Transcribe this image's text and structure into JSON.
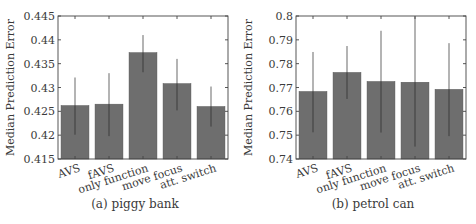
{
  "chart_data": [
    {
      "type": "bar",
      "title": "",
      "caption": "(a) piggy bank",
      "xlabel": "",
      "ylabel": "Median Prediction Error",
      "categories": [
        "AVS",
        "fAVS",
        "only function",
        "move focus",
        "att. switch"
      ],
      "values": [
        0.4262,
        0.4265,
        0.4373,
        0.4308,
        0.426
      ],
      "error_low": [
        0.4201,
        0.4198,
        0.4332,
        0.4252,
        0.4218
      ],
      "error_high": [
        0.4321,
        0.433,
        0.441,
        0.436,
        0.4302
      ],
      "ylim": [
        0.415,
        0.445
      ],
      "yticks": [
        0.415,
        0.42,
        0.425,
        0.43,
        0.435,
        0.44,
        0.445
      ],
      "ytick_labels": [
        "0.415",
        "0.42",
        "0.425",
        "0.43",
        "0.435",
        "0.44",
        "0.445"
      ],
      "grid": false,
      "legend": "none"
    },
    {
      "type": "bar",
      "title": "",
      "caption": "(b) petrol can",
      "xlabel": "",
      "ylabel": "Median Prediction Error",
      "categories": [
        "AVS",
        "fAVS",
        "only function",
        "move focus",
        "att. switch"
      ],
      "values": [
        0.7683,
        0.7763,
        0.7725,
        0.7722,
        0.7692
      ],
      "error_low": [
        0.7512,
        0.7652,
        0.7511,
        0.7452,
        0.7496
      ],
      "error_high": [
        0.7849,
        0.7874,
        0.7938,
        0.7998,
        0.7886
      ],
      "ylim": [
        0.74,
        0.8
      ],
      "yticks": [
        0.74,
        0.75,
        0.76,
        0.77,
        0.78,
        0.79,
        0.8
      ],
      "ytick_labels": [
        "0.74",
        "0.75",
        "0.76",
        "0.77",
        "0.78",
        "0.79",
        "0.8"
      ],
      "grid": false,
      "legend": "none"
    }
  ]
}
